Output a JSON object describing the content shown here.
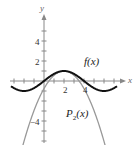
{
  "chart_data": {
    "type": "line",
    "title": "",
    "xlabel": "x",
    "ylabel": "y",
    "xlim": [
      -4,
      8
    ],
    "ylim": [
      -6,
      6
    ],
    "x_ticks": [
      2,
      4
    ],
    "y_ticks": [
      4,
      2,
      -4
    ],
    "grid": false,
    "series": [
      {
        "name": "f(x)",
        "color": "#111111",
        "x": [
          -3,
          -2,
          -1,
          0,
          1,
          2,
          3,
          4,
          5,
          6,
          7
        ],
        "y": [
          -0.71,
          -1.0,
          -0.71,
          0,
          0.71,
          1.0,
          0.71,
          0,
          -0.71,
          -1.0,
          -0.71
        ]
      },
      {
        "name": "P2(x)",
        "color": "#999999",
        "x": [
          -2.2,
          -1,
          0,
          1,
          2,
          3,
          4,
          5,
          6.2
        ],
        "y": [
          -6,
          -2.1,
          -0.4,
          0.6,
          1.0,
          0.6,
          -0.4,
          -2.1,
          -6
        ]
      }
    ]
  },
  "labels": {
    "x_axis": "x",
    "y_axis": "y",
    "tick_x_2": "2",
    "tick_x_4": "4",
    "tick_y_4": "4",
    "tick_y_2": "2",
    "tick_y_neg4": "−4",
    "f_label": "f(x)",
    "p_label_main": "P",
    "p_label_sub": "2",
    "p_label_arg": "(x)"
  }
}
